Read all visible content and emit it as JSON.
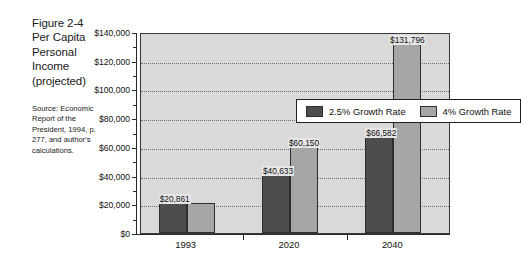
{
  "figure": {
    "title_lines": [
      "Figure 2-4",
      "Per Capita",
      "Personal",
      "Income",
      "(projected)"
    ],
    "source_text": "Source: Economic Report of the President, 1994, p. 277, and author's calculations."
  },
  "chart_data": {
    "type": "bar",
    "title": "Per Capita Personal Income (projected)",
    "xlabel": "",
    "ylabel": "",
    "categories": [
      "1993",
      "2020",
      "2040"
    ],
    "series": [
      {
        "name": "2.5% Growth Rate",
        "color": "#4d4d4d",
        "values": [
          20861,
          40633,
          66582
        ]
      },
      {
        "name": "4% Growth Rate",
        "color": "#a6a6a6",
        "values": [
          20861,
          60150,
          131796
        ]
      }
    ],
    "point_labels": [
      {
        "category": "1993",
        "text": "$20,861"
      },
      {
        "category": "2020",
        "text": "$40,633"
      },
      {
        "category": "2020",
        "text": "$60,150"
      },
      {
        "category": "2040",
        "text": "$66,582"
      },
      {
        "category": "2040",
        "text": "$131,796"
      }
    ],
    "ylim": [
      0,
      140000
    ],
    "ytick_values": [
      0,
      20000,
      40000,
      60000,
      80000,
      100000,
      120000,
      140000
    ],
    "ytick_labels": [
      "$0",
      "$20,000",
      "$40,000",
      "$60,000",
      "$80,000",
      "$100,000",
      "$120,000",
      "$140,000"
    ],
    "grid": true,
    "grid_style": "dotted-horizontal",
    "legend_position": "upper-left-inside",
    "plot_background": "#d9d9d9"
  }
}
